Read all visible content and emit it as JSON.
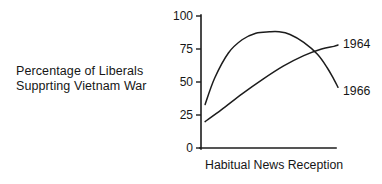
{
  "figure": {
    "caption": {
      "line1": "Percentage of Liberals",
      "line2": "Supprting Vietnam War"
    }
  },
  "chart_data": {
    "type": "line",
    "title": "",
    "subtitle": "",
    "xlabel": "Habitual News Reception",
    "ylabel": "Percentage of Liberals Supprting Vietnam War",
    "ylim": [
      0,
      100
    ],
    "xlim": [
      0,
      100
    ],
    "yticks": [
      "0",
      "25",
      "50",
      "75",
      "100"
    ],
    "ytick_values": [
      0,
      25,
      50,
      75,
      100
    ],
    "xticks": [],
    "grid": false,
    "legend_position": "right-of-line-ends",
    "series": [
      {
        "name": "1966",
        "label": "1966",
        "x": [
          3,
          10,
          20,
          30,
          40,
          50,
          57,
          65,
          75,
          85,
          92,
          97,
          100
        ],
        "values": [
          33,
          53,
          72,
          82,
          87,
          88,
          88,
          86,
          80,
          71,
          61,
          52,
          46
        ]
      },
      {
        "name": "1964",
        "label": "1964",
        "x": [
          3,
          15,
          30,
          45,
          60,
          75,
          88,
          97,
          100
        ],
        "values": [
          20,
          29,
          41,
          52,
          62,
          70,
          75,
          77,
          78
        ]
      }
    ],
    "annotations": [
      {
        "text": "1964",
        "series": "1964",
        "position": "end-right"
      },
      {
        "text": "1966",
        "series": "1966",
        "position": "end-right"
      }
    ],
    "colors": {
      "axis": "#1c1c1c",
      "series_1966": "#1c1c1c",
      "series_1964": "#1c1c1c",
      "background": "#ffffff"
    }
  }
}
